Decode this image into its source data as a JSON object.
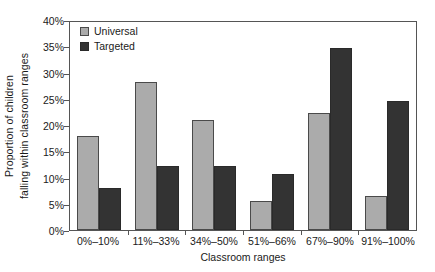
{
  "chart_data": {
    "type": "bar",
    "title": "",
    "xlabel": "Classroom ranges",
    "ylabel": "Proportion of children falling within classroom ranges",
    "ylabel_lines": [
      "Proportion of children",
      "falling within classroom ranges"
    ],
    "categories": [
      "0%–10%",
      "11%–33%",
      "34%–50%",
      "51%–66%",
      "67%–90%",
      "91%–100%"
    ],
    "series": [
      {
        "name": "Universal",
        "color": "#ababab",
        "values": [
          18.0,
          28.1,
          21.0,
          5.5,
          22.2,
          6.4
        ]
      },
      {
        "name": "Targeted",
        "color": "#333333",
        "values": [
          8.0,
          12.1,
          12.1,
          10.6,
          34.7,
          24.5
        ]
      }
    ],
    "ylim": [
      0,
      40
    ],
    "yticks": [
      "0%",
      "5%",
      "10%",
      "15%",
      "20%",
      "25%",
      "30%",
      "35%",
      "40%"
    ],
    "ytick_values": [
      0,
      5,
      10,
      15,
      20,
      25,
      30,
      35,
      40
    ],
    "grid": false,
    "legend_position": "top-left",
    "legend": [
      "Universal",
      "Targeted"
    ]
  }
}
